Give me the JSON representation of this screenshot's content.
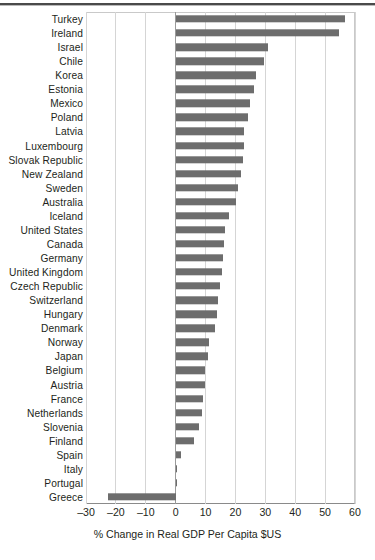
{
  "figure": {
    "top_rule": "horizontal-rule"
  },
  "chart_data": {
    "type": "bar",
    "orientation": "horizontal",
    "title": "",
    "xlabel": "% Change in Real GDP Per Capita $US",
    "ylabel": "",
    "xlim": [
      -30,
      60
    ],
    "xticks": [
      -30,
      -20,
      -10,
      0,
      10,
      20,
      30,
      40,
      50,
      60
    ],
    "xtick_labels": [
      "–30",
      "–20",
      "–10",
      "0",
      "10",
      "20",
      "30",
      "40",
      "50",
      "60"
    ],
    "grid": true,
    "legend": null,
    "bar_color": "#6d6d6d",
    "categories": [
      "Turkey",
      "Ireland",
      "Israel",
      "Chile",
      "Korea",
      "Estonia",
      "Mexico",
      "Poland",
      "Latvia",
      "Luxembourg",
      "Slovak Republic",
      "New Zealand",
      "Sweden",
      "Australia",
      "Iceland",
      "United States",
      "Canada",
      "Germany",
      "United Kingdom",
      "Czech Republic",
      "Switzerland",
      "Hungary",
      "Denmark",
      "Norway",
      "Japan",
      "Belgium",
      "Austria",
      "France",
      "Netherlands",
      "Slovenia",
      "Finland",
      "Spain",
      "Italy",
      "Portugal",
      "Greece"
    ],
    "values": [
      56.7,
      54.7,
      31.0,
      29.7,
      27.0,
      26.3,
      25.0,
      24.3,
      23.0,
      22.7,
      22.4,
      21.7,
      20.9,
      20.1,
      18.0,
      16.4,
      16.2,
      15.9,
      15.4,
      14.9,
      14.2,
      13.8,
      13.2,
      11.0,
      10.9,
      9.9,
      9.8,
      9.2,
      8.7,
      7.7,
      6.0,
      1.8,
      0.3,
      0.5,
      -22.7
    ]
  }
}
